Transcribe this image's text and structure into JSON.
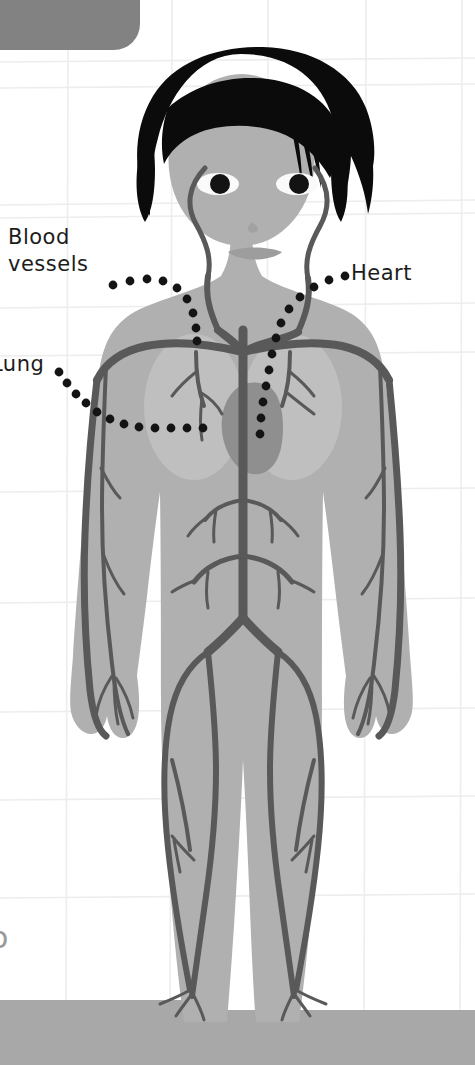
{
  "page": {
    "width": 475,
    "height": 1065,
    "background_color": "#ffffff",
    "grid_line_color": "#ededed",
    "bottom_band_color": "#a8a8a8"
  },
  "corner_tab": {
    "name": "top-left-rounded-tab",
    "color": "#828282",
    "x": -60,
    "y": -40,
    "width": 200,
    "height": 90,
    "radius": 26
  },
  "labels": [
    {
      "id": "blood-vessels",
      "line1": "Blood",
      "line2": "vessels",
      "full_text": "Blood vessels",
      "x": 8,
      "y": 224,
      "leader": "dotted"
    },
    {
      "id": "lung",
      "text": "Lung",
      "clipped_text": "ung",
      "x": -9,
      "y": 351,
      "leader": "dotted",
      "note": "clipped at left edge of frame"
    },
    {
      "id": "heart",
      "text": "Heart",
      "x": 351,
      "y": 260,
      "leader": "dotted"
    }
  ],
  "corner_glyph": {
    "text": "o",
    "note": "partially clipped character at lower-left edge"
  },
  "figure": {
    "name": "child-body-anatomical-figure",
    "skin_color": "#b0b0b0",
    "skin_shadow_color": "#a6a6a6",
    "hair_color": "#0b0b0b",
    "lung_color": "#bfbfbf",
    "heart_color": "#8f8f8f",
    "vessel_color": "#595959",
    "eye_white_color": "#fafafa",
    "pupil_color": "#131313",
    "dot_color": "#141414"
  },
  "organs": [
    {
      "name": "lung-left",
      "label": "Lung"
    },
    {
      "name": "lung-right",
      "label": "Lung"
    },
    {
      "name": "heart",
      "label": "Heart"
    },
    {
      "name": "blood-vessels",
      "label": "Blood vessels"
    }
  ]
}
